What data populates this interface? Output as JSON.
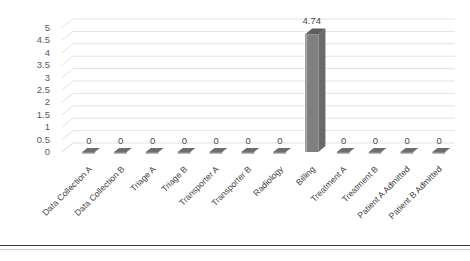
{
  "chart_data": {
    "type": "bar",
    "title": "",
    "xlabel": "",
    "ylabel": "",
    "ylim": [
      0,
      5
    ],
    "yticks": [
      "0",
      "0.5",
      "1",
      "1.5",
      "2",
      "2.5",
      "3",
      "3.5",
      "4",
      "4.5",
      "5"
    ],
    "grid": true,
    "legend": "none",
    "style": "3d-column",
    "bar_color": "#7f7f7f",
    "categories": [
      "Data Collection A",
      "Data Collection B",
      "Triage A",
      "Triage B",
      "Transporter A",
      "Transporter B",
      "Radiology",
      "Billing",
      "Treatment A",
      "Treatment B",
      "Patient A Admitted",
      "Patient B Admitted"
    ],
    "values": [
      0,
      0,
      0,
      0,
      0,
      0,
      0,
      4.74,
      0,
      0,
      0,
      0
    ],
    "data_labels": [
      "0",
      "0",
      "0",
      "0",
      "0",
      "0",
      "0",
      "4.74",
      "0",
      "0",
      "0",
      "0"
    ]
  },
  "colors": {
    "bar_front": "#7f7f7f",
    "bar_side": "#a3a3a3",
    "bar_top": "#5e5e5e",
    "gridline": "#e2e2e4",
    "axis_text": "#4a4a4a",
    "frame_rule": "#3a3a3a"
  }
}
